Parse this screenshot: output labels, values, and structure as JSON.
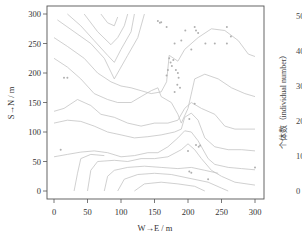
{
  "chart_data": [
    {
      "type": "scatter",
      "subtype": "contour map with point locations",
      "title": "",
      "xlabel": "W→E / m",
      "ylabel": "S→N / m",
      "xlim": [
        0,
        300
      ],
      "ylim": [
        0,
        300
      ],
      "x_ticks": [
        0,
        50,
        100,
        150,
        200,
        250,
        300
      ],
      "y_ticks": [
        0,
        50,
        100,
        150,
        200,
        250,
        300
      ],
      "x_tick_labels": [
        "0",
        "50",
        "100",
        "150",
        "200",
        "250",
        "300"
      ],
      "y_tick_labels": [
        "0",
        "50",
        "100",
        "150",
        "200",
        "250",
        "300"
      ],
      "grid": false,
      "legend": null,
      "colors": {
        "contour": "#c4c4c4",
        "points": "#b0b0b0",
        "frame": "#555555"
      },
      "points": [
        {
          "x": 10,
          "y": 70
        },
        {
          "x": 15,
          "y": 192
        },
        {
          "x": 20,
          "y": 192
        },
        {
          "x": 155,
          "y": 288
        },
        {
          "x": 158,
          "y": 285
        },
        {
          "x": 160,
          "y": 286
        },
        {
          "x": 168,
          "y": 278
        },
        {
          "x": 172,
          "y": 225
        },
        {
          "x": 174,
          "y": 218
        },
        {
          "x": 176,
          "y": 212
        },
        {
          "x": 178,
          "y": 222
        },
        {
          "x": 170,
          "y": 205
        },
        {
          "x": 168,
          "y": 196
        },
        {
          "x": 180,
          "y": 250
        },
        {
          "x": 182,
          "y": 205
        },
        {
          "x": 185,
          "y": 200
        },
        {
          "x": 186,
          "y": 192
        },
        {
          "x": 184,
          "y": 180
        },
        {
          "x": 188,
          "y": 175
        },
        {
          "x": 180,
          "y": 168
        },
        {
          "x": 190,
          "y": 255
        },
        {
          "x": 196,
          "y": 272
        },
        {
          "x": 205,
          "y": 240
        },
        {
          "x": 210,
          "y": 278
        },
        {
          "x": 212,
          "y": 272
        },
        {
          "x": 215,
          "y": 268
        },
        {
          "x": 226,
          "y": 250
        },
        {
          "x": 240,
          "y": 250
        },
        {
          "x": 258,
          "y": 250
        },
        {
          "x": 258,
          "y": 278
        },
        {
          "x": 264,
          "y": 262
        },
        {
          "x": 210,
          "y": 148
        },
        {
          "x": 202,
          "y": 122
        },
        {
          "x": 212,
          "y": 78
        },
        {
          "x": 216,
          "y": 75
        },
        {
          "x": 218,
          "y": 77
        },
        {
          "x": 200,
          "y": 68
        },
        {
          "x": 202,
          "y": 33
        },
        {
          "x": 205,
          "y": 31
        },
        {
          "x": 230,
          "y": 20
        },
        {
          "x": 300,
          "y": 40
        }
      ],
      "contours": [
        [
          [
            5,
            290
          ],
          [
            30,
            270
          ],
          [
            55,
            250
          ],
          [
            75,
            225
          ],
          [
            90,
            190
          ],
          [
            110,
            230
          ],
          [
            125,
            260
          ],
          [
            135,
            300
          ]
        ],
        [
          [
            20,
            300
          ],
          [
            40,
            280
          ],
          [
            60,
            255
          ],
          [
            80,
            230
          ],
          [
            90,
            218
          ],
          [
            100,
            240
          ],
          [
            115,
            270
          ],
          [
            120,
            300
          ]
        ],
        [
          [
            45,
            300
          ],
          [
            65,
            270
          ],
          [
            85,
            248
          ],
          [
            95,
            260
          ],
          [
            105,
            280
          ],
          [
            110,
            300
          ]
        ],
        [
          [
            70,
            300
          ],
          [
            80,
            285
          ],
          [
            90,
            280
          ],
          [
            95,
            295
          ]
        ],
        [
          [
            0,
            260
          ],
          [
            20,
            245
          ],
          [
            45,
            225
          ],
          [
            65,
            200
          ],
          [
            85,
            185
          ],
          [
            100,
            178
          ],
          [
            115,
            175
          ],
          [
            130,
            170
          ],
          [
            145,
            165
          ],
          [
            160,
            168
          ],
          [
            168,
            185
          ],
          [
            172,
            230
          ],
          [
            185,
            220
          ],
          [
            195,
            240
          ],
          [
            215,
            260
          ],
          [
            235,
            275
          ],
          [
            255,
            272
          ],
          [
            275,
            255
          ],
          [
            290,
            232
          ],
          [
            300,
            228
          ]
        ],
        [
          [
            0,
            225
          ],
          [
            20,
            210
          ],
          [
            40,
            190
          ],
          [
            60,
            165
          ],
          [
            80,
            155
          ],
          [
            95,
            150
          ],
          [
            115,
            150
          ],
          [
            130,
            160
          ],
          [
            145,
            170
          ],
          [
            155,
            175
          ],
          [
            160,
            160
          ],
          [
            175,
            150
          ],
          [
            185,
            130
          ],
          [
            190,
            115
          ],
          [
            200,
            140
          ],
          [
            210,
            190
          ],
          [
            225,
            198
          ],
          [
            245,
            190
          ],
          [
            265,
            175
          ],
          [
            285,
            165
          ],
          [
            300,
            160
          ]
        ],
        [
          [
            0,
            135
          ],
          [
            15,
            140
          ],
          [
            35,
            155
          ],
          [
            55,
            145
          ],
          [
            70,
            130
          ],
          [
            90,
            125
          ],
          [
            110,
            115
          ],
          [
            130,
            110
          ],
          [
            150,
            115
          ],
          [
            170,
            115
          ],
          [
            185,
            120
          ],
          [
            195,
            140
          ],
          [
            205,
            150
          ],
          [
            220,
            140
          ],
          [
            240,
            130
          ],
          [
            255,
            110
          ],
          [
            270,
            105
          ],
          [
            300,
            105
          ]
        ],
        [
          [
            0,
            115
          ],
          [
            20,
            120
          ],
          [
            40,
            118
          ],
          [
            60,
            110
          ],
          [
            80,
            100
          ],
          [
            100,
            95
          ],
          [
            120,
            90
          ],
          [
            140,
            92
          ],
          [
            160,
            95
          ],
          [
            180,
            100
          ],
          [
            190,
            105
          ],
          [
            195,
            125
          ],
          [
            205,
            132
          ],
          [
            215,
            120
          ],
          [
            225,
            90
          ],
          [
            240,
            75
          ],
          [
            260,
            70
          ],
          [
            280,
            70
          ],
          [
            300,
            68
          ]
        ],
        [
          [
            0,
            58
          ],
          [
            20,
            62
          ],
          [
            40,
            66
          ],
          [
            60,
            68
          ],
          [
            80,
            65
          ],
          [
            100,
            58
          ],
          [
            120,
            60
          ],
          [
            140,
            65
          ],
          [
            155,
            65
          ],
          [
            170,
            75
          ],
          [
            185,
            90
          ],
          [
            195,
            102
          ],
          [
            205,
            100
          ],
          [
            215,
            85
          ],
          [
            230,
            55
          ],
          [
            240,
            45
          ],
          [
            260,
            40
          ],
          [
            280,
            38
          ],
          [
            300,
            36
          ]
        ],
        [
          [
            30,
            0
          ],
          [
            35,
            30
          ],
          [
            40,
            55
          ],
          [
            55,
            62
          ],
          [
            75,
            60
          ]
        ],
        [
          [
            50,
            0
          ],
          [
            55,
            35
          ],
          [
            65,
            50
          ],
          [
            90,
            52
          ],
          [
            110,
            50
          ],
          [
            130,
            55
          ],
          [
            150,
            55
          ],
          [
            170,
            58
          ],
          [
            190,
            70
          ],
          [
            200,
            80
          ],
          [
            210,
            70
          ],
          [
            220,
            55
          ],
          [
            235,
            35
          ],
          [
            250,
            25
          ],
          [
            270,
            15
          ],
          [
            300,
            10
          ]
        ],
        [
          [
            75,
            0
          ],
          [
            80,
            25
          ],
          [
            90,
            35
          ],
          [
            110,
            40
          ],
          [
            135,
            42
          ],
          [
            160,
            40
          ],
          [
            185,
            38
          ],
          [
            205,
            40
          ],
          [
            225,
            35
          ],
          [
            245,
            30
          ]
        ],
        [
          [
            95,
            0
          ],
          [
            105,
            20
          ],
          [
            125,
            28
          ],
          [
            150,
            30
          ],
          [
            175,
            28
          ],
          [
            200,
            22
          ],
          [
            230,
            15
          ],
          [
            250,
            5
          ],
          [
            260,
            0
          ]
        ],
        [
          [
            120,
            0
          ],
          [
            135,
            12
          ],
          [
            160,
            15
          ],
          [
            185,
            12
          ],
          [
            210,
            8
          ],
          [
            225,
            0
          ]
        ]
      ]
    },
    {
      "type": "partial",
      "note": "second panel cropped at right edge; only y-axis visible",
      "ylabel": "个体数（individual number）",
      "y_tick_labels": [
        "0",
        "10",
        "20",
        "30",
        "40",
        "50"
      ],
      "ylim": [
        0,
        50
      ]
    }
  ],
  "panel_left": {
    "xlabel": "W→E / m",
    "ylabel": "S→N / m",
    "x_ticks": [
      "0",
      "50",
      "100",
      "150",
      "200",
      "250",
      "300"
    ],
    "y_ticks": [
      "0",
      "50",
      "100",
      "150",
      "200",
      "250",
      "300"
    ]
  },
  "panel_right": {
    "ylabel": "个体数（individual number）",
    "y_ticks": [
      "0",
      "10",
      "20",
      "30",
      "40",
      "50"
    ]
  }
}
